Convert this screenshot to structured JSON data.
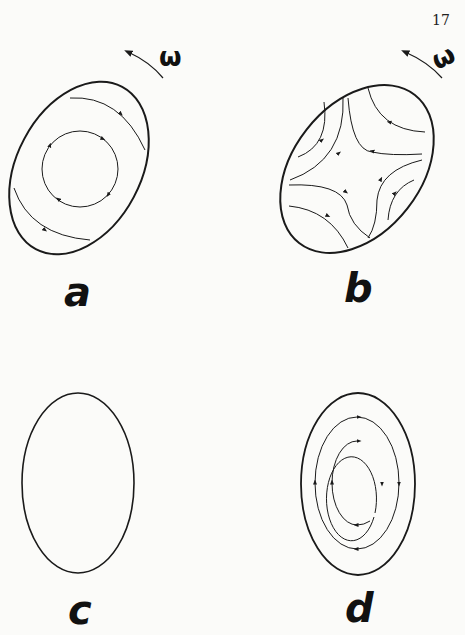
{
  "page": {
    "number": "17"
  },
  "panels": [
    {
      "id": "a",
      "label": "a",
      "rotation_symbol": "ω",
      "description": "Tilted elliptical container rotating with angular velocity omega; closed circular streamline plus an outer streamline circulating clockwise"
    },
    {
      "id": "b",
      "label": "b",
      "rotation_symbol": "ω",
      "description": "Tilted elliptical container rotating with angular velocity omega; hyperbolic (strain) streamlines in four quadrants"
    },
    {
      "id": "c",
      "label": "c",
      "description": "Upright ellipse with no interior flow"
    },
    {
      "id": "d",
      "label": "d",
      "description": "Upright ellipse with two concentric elliptical streamlines circulating clockwise"
    }
  ],
  "colors": {
    "ink": "#1a1a1a",
    "paper": "#fbfbf9"
  }
}
